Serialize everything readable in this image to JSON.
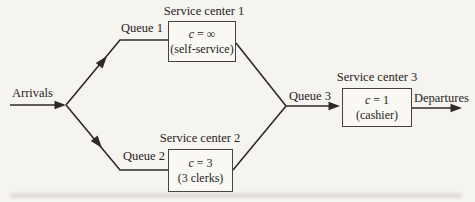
{
  "figure": {
    "paper_color": "#f6f4f0",
    "ink_color": "#2e2b27"
  },
  "labels": {
    "arrivals": "Arrivals",
    "departures": "Departures",
    "queue1": "Queue 1",
    "queue2": "Queue 2",
    "queue3": "Queue 3"
  },
  "service_centers": [
    {
      "title": "Service center 1",
      "capacity": "c = ∞",
      "note": "(self-service)"
    },
    {
      "title": "Service center 2",
      "capacity": "c = 3",
      "note": "(3 clerks)"
    },
    {
      "title": "Service center 3",
      "capacity": "c = 1",
      "note": "(cashier)"
    }
  ],
  "flow": {
    "source": "Arrivals",
    "branches": [
      "Queue 1 → Service center 1",
      "Queue 2 → Service center 2"
    ],
    "merge": "Queue 3 → Service center 3",
    "sink": "Departures"
  }
}
